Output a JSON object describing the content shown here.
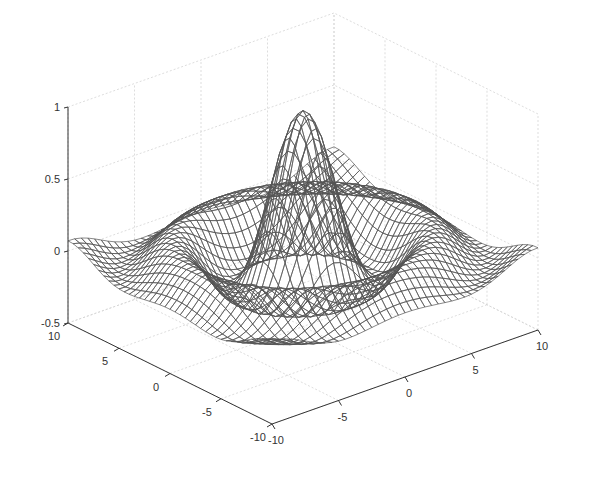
{
  "chart_data": {
    "type": "surface-mesh",
    "title": "",
    "function": "z = sin(R)/R, R = sqrt(x^2 + y^2) + eps",
    "xlabel": "",
    "ylabel": "",
    "zlabel": "",
    "xlim": [
      -10,
      10
    ],
    "ylim": [
      -10,
      10
    ],
    "zlim": [
      -0.5,
      1
    ],
    "x_ticks": [
      -10,
      -5,
      0,
      5,
      10
    ],
    "y_ticks": [
      -10,
      -5,
      0,
      5,
      10
    ],
    "z_ticks": [
      -0.5,
      0,
      0.5,
      1
    ],
    "x_tick_labels": [
      "-10",
      "-5",
      "0",
      "5",
      "10"
    ],
    "y_tick_labels": [
      "-10",
      "-5",
      "0",
      "5",
      "10"
    ],
    "z_tick_labels": [
      "-0.5",
      "0",
      "0.5",
      "1"
    ],
    "grid_step": 0.5,
    "grid": true,
    "legend": null,
    "peak": {
      "x": 0,
      "y": 0,
      "z": 1
    },
    "first_trough_z": -0.22,
    "edge_color": "#555555",
    "face_color": "#ffffff"
  }
}
